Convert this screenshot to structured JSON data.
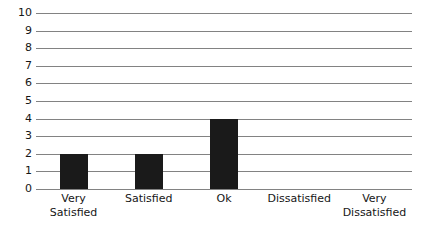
{
  "chart_data": {
    "type": "bar",
    "title": "",
    "subtitle": "",
    "xlabel": "",
    "ylabel": "",
    "categories": [
      "Very Satisfied",
      "Satisfied",
      "Ok",
      "Dissatisfied",
      "Very Dissatisfied"
    ],
    "category_lines": [
      [
        "Very",
        "Satisfied"
      ],
      [
        "Satisfied"
      ],
      [
        "Ok"
      ],
      [
        "Dissatisfied"
      ],
      [
        "Very",
        "Dissatisfied"
      ]
    ],
    "values": [
      2,
      2,
      4,
      0,
      0
    ],
    "ylim": [
      0,
      10
    ],
    "ytick_labels": [
      "10",
      "9",
      "8",
      "7",
      "6",
      "5",
      "4",
      "3",
      "2",
      "1",
      "0"
    ],
    "ytick_values": [
      10,
      9,
      8,
      7,
      6,
      5,
      4,
      3,
      2,
      1,
      0
    ],
    "grid": true,
    "grid_orientation": "horizontal",
    "legend": false,
    "legend_position": "none",
    "bar_color": "#1a1a1a",
    "grid_color": "#828282",
    "background_color": "#ffffff",
    "text_color": "#161616",
    "annotations": []
  }
}
